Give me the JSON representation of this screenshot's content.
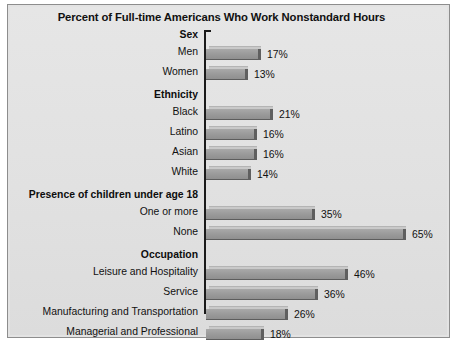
{
  "chart_data": {
    "type": "bar",
    "orientation": "horizontal",
    "title": "Percent of Full-time Americans Who Work Nonstandard Hours",
    "xlabel": "",
    "ylabel": "",
    "xlim": [
      0,
      65
    ],
    "grid": false,
    "legend": null,
    "value_suffix": "%",
    "groups": [
      {
        "header": "Sex",
        "categories": [
          "Men",
          "Women"
        ],
        "values": [
          17,
          13
        ],
        "labels": [
          "17%",
          "13%"
        ]
      },
      {
        "header": "Ethnicity",
        "categories": [
          "Black",
          "Latino",
          "Asian",
          "White"
        ],
        "values": [
          21,
          16,
          16,
          14
        ],
        "labels": [
          "21%",
          "16%",
          "16%",
          "14%"
        ]
      },
      {
        "header": "Presence of children under age 18",
        "categories": [
          "One or more",
          "None"
        ],
        "values": [
          35,
          65
        ],
        "labels": [
          "35%",
          "65%"
        ]
      },
      {
        "header": "Occupation",
        "categories": [
          "Leisure and Hospitality",
          "Service",
          "Manufacturing and Transportation",
          "Managerial and Professional"
        ],
        "values": [
          46,
          36,
          26,
          18
        ],
        "labels": [
          "46%",
          "36%",
          "26%",
          "18%"
        ]
      }
    ],
    "categories": [
      "Men",
      "Women",
      "Black",
      "Latino",
      "Asian",
      "White",
      "One or more",
      "None",
      "Leisure and Hospitality",
      "Service",
      "Manufacturing and Transportation",
      "Managerial and Professional"
    ],
    "values": [
      17,
      13,
      21,
      16,
      16,
      14,
      35,
      65,
      46,
      36,
      26,
      18
    ],
    "colors": {
      "bar_front": "#9c9c9c",
      "bar_top": "#c9c9c9",
      "bar_side": "#5f5f5f",
      "panel_background": "#e3e3e3",
      "panel_border": "#8d8d8d",
      "axis": "#1a1a1a",
      "text": "#111111"
    }
  }
}
